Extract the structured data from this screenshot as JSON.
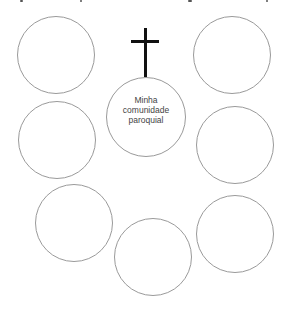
{
  "diagram": {
    "center": {
      "label_lines": [
        "Minha",
        "comunidade",
        "paroquial"
      ]
    },
    "cross_icon": "latin-cross",
    "outer_circles": [
      {
        "id": "top-left",
        "label": ""
      },
      {
        "id": "top-right",
        "label": ""
      },
      {
        "id": "middle-left",
        "label": ""
      },
      {
        "id": "middle-right",
        "label": ""
      },
      {
        "id": "bottom-left",
        "label": ""
      },
      {
        "id": "bottom-center",
        "label": ""
      },
      {
        "id": "bottom-right",
        "label": ""
      }
    ],
    "colors": {
      "circle_stroke": "#9a9a9a",
      "cross": "#111111",
      "text": "#444444"
    }
  }
}
